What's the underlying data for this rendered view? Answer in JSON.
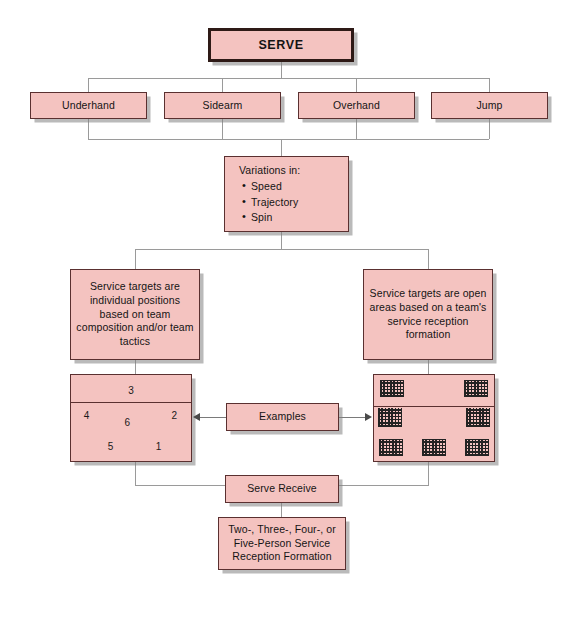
{
  "diagram": {
    "title": "SERVE",
    "serve_types": [
      {
        "label": "Underhand"
      },
      {
        "label": "Sidearm"
      },
      {
        "label": "Overhand"
      },
      {
        "label": "Jump"
      }
    ],
    "variations": {
      "heading": "Variations in:",
      "items": [
        "Speed",
        "Trajectory",
        "Spin"
      ]
    },
    "branch_left": {
      "description": "Service targets are individual positions based on team composition and/or team tactics",
      "court_label": "individual-positions-court",
      "positions": [
        {
          "number": "3",
          "x": 50,
          "y": 18
        },
        {
          "number": "4",
          "x": 13,
          "y": 47
        },
        {
          "number": "6",
          "x": 47,
          "y": 55
        },
        {
          "number": "2",
          "x": 86,
          "y": 47
        },
        {
          "number": "5",
          "x": 33,
          "y": 82
        },
        {
          "number": "1",
          "x": 73,
          "y": 82
        }
      ]
    },
    "branch_right": {
      "description": "Service targets are open areas based on a team's service reception formation",
      "court_label": "open-areas-court",
      "zones": [
        {
          "x": 5,
          "y": 6,
          "w": 20,
          "h": 20
        },
        {
          "x": 75,
          "y": 6,
          "w": 20,
          "h": 20
        },
        {
          "x": 3,
          "y": 38,
          "w": 20,
          "h": 22
        },
        {
          "x": 77,
          "y": 38,
          "w": 20,
          "h": 22
        },
        {
          "x": 4,
          "y": 74,
          "w": 20,
          "h": 20
        },
        {
          "x": 40,
          "y": 74,
          "w": 20,
          "h": 20
        },
        {
          "x": 76,
          "y": 74,
          "w": 20,
          "h": 20
        }
      ]
    },
    "examples_label": "Examples",
    "serve_receive_label": "Serve Receive",
    "formation": "Two-, Three-, Four-, or Five-Person Service Reception Formation",
    "colors": {
      "box_fill": "#f4c3c0",
      "box_border": "#5a3030",
      "title_border": "#2e1a16",
      "connector": "#9a9a9a",
      "zone_hatch": "#232323",
      "text": "#141414",
      "background": "#ffffff"
    }
  }
}
